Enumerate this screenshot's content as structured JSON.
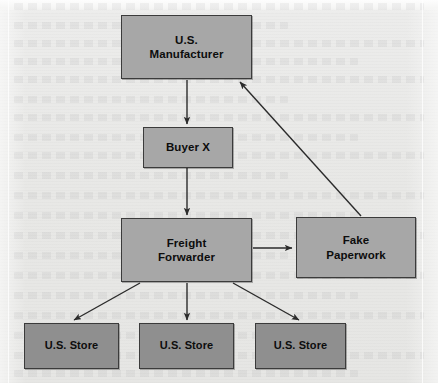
{
  "diagram": {
    "background_color": "#e8e8e6",
    "node_fill": "#a7a7a7",
    "store_fill": "#8f8f8f",
    "border_color": "#3b3b3b",
    "arrow_color": "#2b2b2b",
    "nodes": [
      {
        "id": "manufacturer",
        "label": "U.S.\nManufacturer",
        "x": 121,
        "y": 15,
        "w": 131,
        "h": 64,
        "kind": "entity"
      },
      {
        "id": "buyer",
        "label": "Buyer X",
        "x": 143,
        "y": 127,
        "w": 90,
        "h": 41,
        "kind": "entity"
      },
      {
        "id": "forwarder",
        "label": "Freight\nForwarder",
        "x": 121,
        "y": 218,
        "w": 131,
        "h": 64,
        "kind": "entity"
      },
      {
        "id": "paperwork",
        "label": "Fake\nPaperwork",
        "x": 296,
        "y": 217,
        "w": 120,
        "h": 61,
        "kind": "entity"
      },
      {
        "id": "store1",
        "label": "U.S. Store",
        "x": 24,
        "y": 323,
        "w": 95,
        "h": 46,
        "kind": "store"
      },
      {
        "id": "store2",
        "label": "U.S. Store",
        "x": 139,
        "y": 323,
        "w": 95,
        "h": 46,
        "kind": "store"
      },
      {
        "id": "store3",
        "label": "U.S. Store",
        "x": 255,
        "y": 323,
        "w": 91,
        "h": 46,
        "kind": "store"
      }
    ],
    "edges": [
      {
        "id": "manufacturer-to-buyer",
        "from": "manufacturer",
        "to": "buyer",
        "x1": 187,
        "y1": 80,
        "x2": 187,
        "y2": 124
      },
      {
        "id": "buyer-to-forwarder",
        "from": "buyer",
        "to": "forwarder",
        "x1": 187,
        "y1": 168,
        "x2": 187,
        "y2": 215
      },
      {
        "id": "forwarder-to-paperwork",
        "from": "forwarder",
        "to": "paperwork",
        "x1": 253,
        "y1": 248,
        "x2": 292,
        "y2": 248
      },
      {
        "id": "paperwork-to-manufacturer",
        "from": "paperwork",
        "to": "manufacturer",
        "x1": 361,
        "y1": 216,
        "x2": 240,
        "y2": 82
      },
      {
        "id": "forwarder-to-store1",
        "from": "forwarder",
        "to": "store1",
        "x1": 140,
        "y1": 283,
        "x2": 74,
        "y2": 320
      },
      {
        "id": "forwarder-to-store2",
        "from": "forwarder",
        "to": "store2",
        "x1": 187,
        "y1": 283,
        "x2": 187,
        "y2": 320
      },
      {
        "id": "forwarder-to-store3",
        "from": "forwarder",
        "to": "store3",
        "x1": 233,
        "y1": 283,
        "x2": 299,
        "y2": 320
      }
    ]
  }
}
